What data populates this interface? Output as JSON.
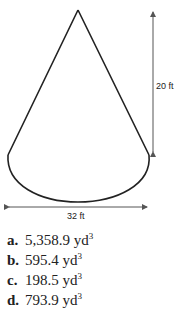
{
  "figure": {
    "shape": "cone",
    "height_label": "20 ft",
    "diameter_label": "32 ft",
    "stroke_color": "#222222",
    "arrow_color": "#555555"
  },
  "options": [
    {
      "letter": "a.",
      "value": "5,358.9 yd",
      "unit_power": "3"
    },
    {
      "letter": "b.",
      "value": "595.4 yd",
      "unit_power": "3"
    },
    {
      "letter": "c.",
      "value": "198.5 yd",
      "unit_power": "3"
    },
    {
      "letter": "d.",
      "value": "793.9 yd",
      "unit_power": "3"
    }
  ]
}
